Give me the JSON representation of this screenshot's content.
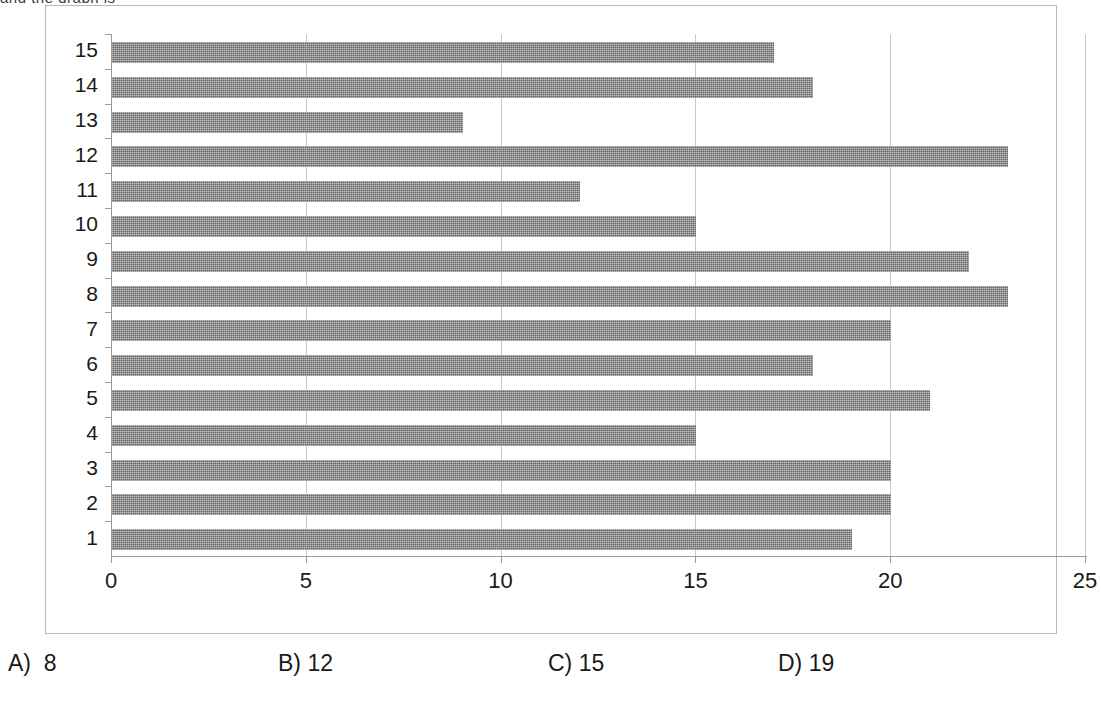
{
  "page": {
    "top_cut_text": "and the graph is"
  },
  "chart_data": {
    "type": "bar",
    "orientation": "horizontal",
    "title": "",
    "subtitle": "",
    "xlabel": "",
    "ylabel": "",
    "categories": [
      "1",
      "2",
      "3",
      "4",
      "5",
      "6",
      "7",
      "8",
      "9",
      "10",
      "11",
      "12",
      "13",
      "14",
      "15"
    ],
    "values": [
      19,
      20,
      20,
      15,
      21,
      18,
      20,
      23,
      22,
      15,
      12,
      23,
      9,
      18,
      17
    ],
    "series": [
      {
        "name": "Series 1",
        "values": [
          19,
          20,
          20,
          15,
          21,
          18,
          20,
          23,
          22,
          15,
          12,
          23,
          9,
          18,
          17
        ]
      }
    ],
    "xlim": [
      0,
      25
    ],
    "xticks": [
      0,
      5,
      10,
      15,
      20,
      25
    ],
    "xtick_labels": [
      "0",
      "5",
      "10",
      "15",
      "20",
      "25"
    ],
    "ytick_labels": [
      "15",
      "14",
      "13",
      "12",
      "11",
      "10",
      "9",
      "8",
      "7",
      "6",
      "5",
      "4",
      "3",
      "2",
      "1"
    ],
    "grid": true,
    "grid_axis": "x",
    "legend": false,
    "legend_position": "none",
    "bar_color": "#7c7c7c",
    "gridline_color": "#c8c8c8",
    "axis_color": "#9b9b9b",
    "frame_color": "#b9b9b9"
  },
  "answers": [
    {
      "label": "A)",
      "value": "8",
      "text": "A)  8"
    },
    {
      "label": "B)",
      "value": "12",
      "text": "B) 12"
    },
    {
      "label": "C)",
      "value": "15",
      "text": "C) 15"
    },
    {
      "label": "D)",
      "value": "19",
      "text": "D) 19"
    }
  ]
}
